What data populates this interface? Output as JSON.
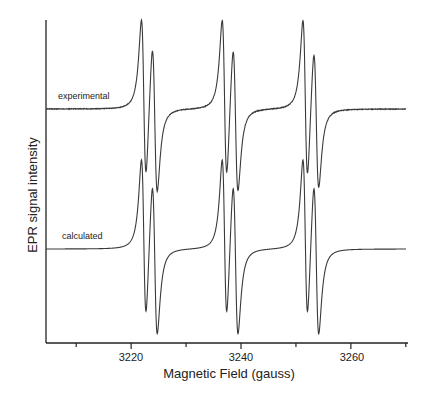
{
  "chart_data": {
    "type": "line",
    "title": "",
    "xlabel": "Magnetic Field (gauss)",
    "ylabel": "EPR signal intensity",
    "xlim": [
      3204.5,
      3270.4
    ],
    "x_major_ticks": [
      3220,
      3240,
      3260
    ],
    "x_minor_ticks": [
      3210,
      3230,
      3250,
      3270
    ],
    "y_ticks": [],
    "grid": false,
    "legend": "none (inline trace labels)",
    "series": [
      {
        "name": "experimental",
        "baseline_px": 109,
        "peak_amp_px": 82,
        "lines": [
          {
            "center": 3222.3,
            "width": 0.75,
            "amp": 1.0
          },
          {
            "center": 3224.3,
            "width": 0.8,
            "amp": 0.93
          },
          {
            "center": 3237.0,
            "width": 0.75,
            "amp": 1.0
          },
          {
            "center": 3239.0,
            "width": 0.8,
            "amp": 0.92
          },
          {
            "center": 3251.7,
            "width": 0.75,
            "amp": 1.0
          },
          {
            "center": 3253.7,
            "width": 0.8,
            "amp": 0.88
          }
        ],
        "noise": true
      },
      {
        "name": "calculated",
        "baseline_px": 249,
        "peak_amp_px": 82,
        "lines": [
          {
            "center": 3222.3,
            "width": 0.75,
            "amp": 1.0
          },
          {
            "center": 3224.3,
            "width": 0.8,
            "amp": 0.96
          },
          {
            "center": 3237.0,
            "width": 0.75,
            "amp": 1.0
          },
          {
            "center": 3239.0,
            "width": 0.8,
            "amp": 0.96
          },
          {
            "center": 3251.7,
            "width": 0.75,
            "amp": 1.0
          },
          {
            "center": 3253.7,
            "width": 0.8,
            "amp": 0.96
          }
        ],
        "noise": false
      }
    ],
    "annotations": [
      {
        "text": "experimental",
        "trace": "experimental"
      },
      {
        "text": "calculated",
        "trace": "calculated"
      }
    ]
  },
  "labels": {
    "xlabel": "Magnetic Field (gauss)",
    "ylabel": "EPR signal intensity",
    "experimental": "experimental",
    "calculated": "calculated",
    "tick_3220": "3220",
    "tick_3240": "3240",
    "tick_3260": "3260"
  },
  "colors": {
    "trace": "#3a3a3a",
    "axis": "#222222"
  }
}
